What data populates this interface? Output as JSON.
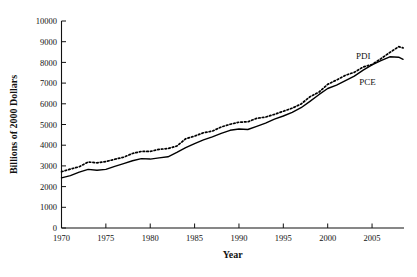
{
  "chart_data": {
    "type": "line",
    "title": "",
    "xlabel": "Year",
    "ylabel": "Billions of 2000 Dollars",
    "xlim": [
      1970,
      2008.6
    ],
    "ylim": [
      0,
      10000
    ],
    "grid": false,
    "legend_position": "inline-right",
    "xticks": [
      1970,
      1975,
      1980,
      1985,
      1990,
      1995,
      2000,
      2005
    ],
    "xtick_labels": [
      "1970",
      "1975",
      "1980",
      "1985",
      "1990",
      "1995",
      "2000",
      "2005"
    ],
    "yticks": [
      0,
      1000,
      2000,
      3000,
      4000,
      5000,
      6000,
      7000,
      8000,
      9000,
      10000
    ],
    "ytick_labels": [
      "0",
      "1000",
      "2000",
      "3000",
      "4000",
      "5000",
      "6000",
      "7000",
      "8000",
      "9000",
      "10000"
    ],
    "x": [
      1970,
      1971,
      1972,
      1973,
      1974,
      1975,
      1976,
      1977,
      1978,
      1979,
      1980,
      1981,
      1982,
      1983,
      1984,
      1985,
      1986,
      1987,
      1988,
      1989,
      1990,
      1991,
      1992,
      1993,
      1994,
      1995,
      1996,
      1997,
      1998,
      1999,
      2000,
      2001,
      2002,
      2003,
      2004,
      2005,
      2006,
      2007,
      2008,
      2008.5
    ],
    "series": [
      {
        "name": "PDI",
        "style": "dotted",
        "color": "#000000",
        "values": [
          2720,
          2845,
          2960,
          3190,
          3150,
          3210,
          3320,
          3420,
          3600,
          3700,
          3700,
          3800,
          3840,
          3960,
          4310,
          4440,
          4600,
          4680,
          4880,
          5010,
          5110,
          5130,
          5300,
          5360,
          5490,
          5640,
          5790,
          5990,
          6340,
          6560,
          6940,
          7150,
          7380,
          7520,
          7780,
          7900,
          8180,
          8480,
          8760,
          8700
        ],
        "label_x": 2004.0,
        "label_y": 8180,
        "label_text": "PDI"
      },
      {
        "name": "PCE",
        "style": "solid",
        "color": "#000000",
        "values": [
          2420,
          2530,
          2700,
          2830,
          2790,
          2830,
          2980,
          3110,
          3250,
          3350,
          3330,
          3390,
          3440,
          3650,
          3880,
          4080,
          4260,
          4400,
          4570,
          4720,
          4780,
          4760,
          4910,
          5070,
          5260,
          5410,
          5590,
          5810,
          6120,
          6440,
          6740,
          6900,
          7120,
          7340,
          7630,
          7880,
          8080,
          8270,
          8250,
          8150
        ],
        "label_x": 2004.5,
        "label_y": 6900,
        "label_text": "PCE"
      }
    ]
  }
}
